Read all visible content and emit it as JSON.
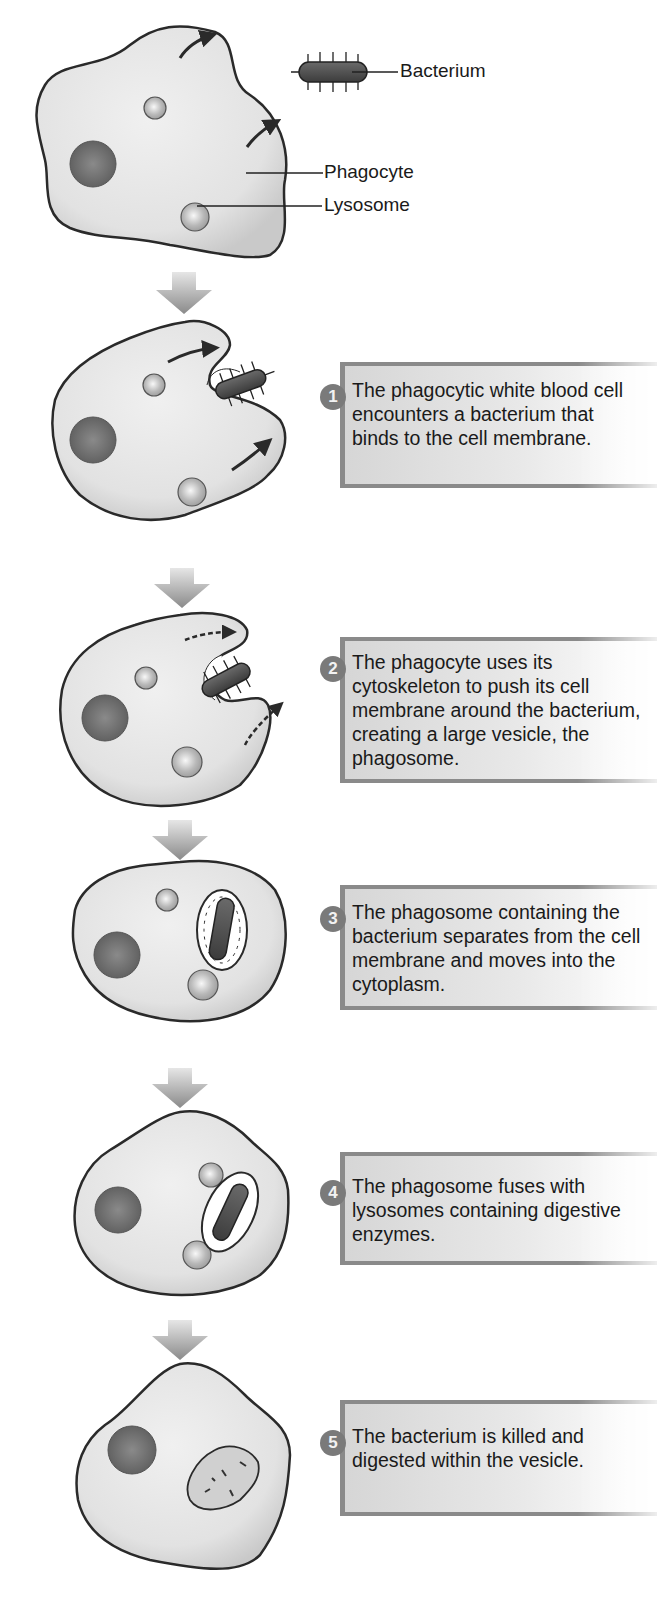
{
  "labels": {
    "bacterium": "Bacterium",
    "phagocyte": "Phagocyte",
    "lysosome": "Lysosome"
  },
  "steps": [
    {
      "number": "1",
      "text": "The phagocytic white blood cell encounters a bacterium that binds to the cell membrane."
    },
    {
      "number": "2",
      "text": "The phagocyte uses its cytoskeleton to push its cell membrane around the bacterium, creating a large vesicle, the phagosome."
    },
    {
      "number": "3",
      "text": "The phagosome containing the bacterium separates from the cell membrane and moves into the cytoplasm."
    },
    {
      "number": "4",
      "text": "The phagosome fuses with lysosomes containing digestive enzymes."
    },
    {
      "number": "5",
      "text": "The bacterium is killed and digested within the vesicle."
    }
  ],
  "colors": {
    "cell_fill": "#e4e4e4",
    "cell_outline": "#2a2a2a",
    "box_border": "#8a8a8a",
    "number_badge": "#7a7a7a",
    "arrow": "#9a9a9a"
  }
}
